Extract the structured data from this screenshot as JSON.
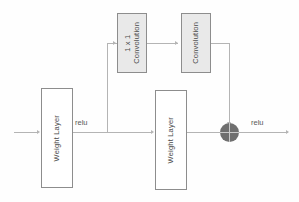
{
  "diagram": {
    "background_color": "#fefefe",
    "line_color": "#b4b4b4",
    "box_border_color": "#8d8d8d",
    "box_fill_white": "#ffffff",
    "box_fill_gray": "#e9e9e9",
    "sum_node_color": "#6f6f6f",
    "text_color": "#4a4a4a"
  },
  "nodes": {
    "weight_layer_1": {
      "label": "Weight Layer"
    },
    "weight_layer_2": {
      "label": "Weight Layer"
    },
    "conv_1x1": {
      "label": "1 x 1\nConvolution"
    },
    "conv_2": {
      "label": "Convolution"
    },
    "sum": {
      "label": "+"
    }
  },
  "edge_labels": {
    "relu_1": "relu",
    "relu_2": "relu"
  }
}
